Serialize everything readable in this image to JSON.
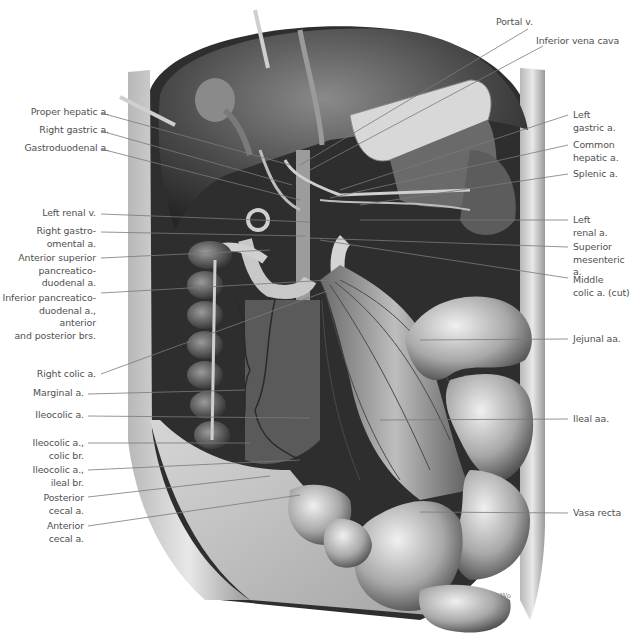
{
  "figure": {
    "style": "grayscale anatomical illustration",
    "signature": "Wo"
  },
  "labels_left": [
    {
      "id": "proper-hepatic-a",
      "text": "Proper hepatic a."
    },
    {
      "id": "right-gastric-a",
      "text": "Right gastric a."
    },
    {
      "id": "gastroduodenal-a",
      "text": "Gastroduodenal a."
    },
    {
      "id": "left-renal-v",
      "text": "Left renal v."
    },
    {
      "id": "right-gastro-omental-a",
      "text": "Right gastro-\nomental a."
    },
    {
      "id": "anterior-superior-pancreaticoduodenal-a",
      "text": "Anterior superior\npancreatico-\nduodenal a."
    },
    {
      "id": "inferior-pancreaticoduodenal-a",
      "text": "Inferior pancreatico-\nduodenal a., anterior\nand posterior brs."
    },
    {
      "id": "right-colic-a",
      "text": "Right colic a."
    },
    {
      "id": "marginal-a",
      "text": "Marginal a."
    },
    {
      "id": "ileocolic-a",
      "text": "Ileocolic a."
    },
    {
      "id": "ileocolic-a-colic-br",
      "text": "Ileocolic a.,\ncolic br."
    },
    {
      "id": "ileocolic-a-ileal-br",
      "text": "Ileocolic a.,\nileal br."
    },
    {
      "id": "posterior-cecal-a",
      "text": "Posterior\ncecal a."
    },
    {
      "id": "anterior-cecal-a",
      "text": "Anterior\ncecal a."
    }
  ],
  "labels_right": [
    {
      "id": "portal-v",
      "text": "Portal v."
    },
    {
      "id": "inferior-vena-cava",
      "text": "Inferior vena cava"
    },
    {
      "id": "left-gastric-a",
      "text": "Left\ngastric a."
    },
    {
      "id": "common-hepatic-a",
      "text": "Common\nhepatic a."
    },
    {
      "id": "splenic-a",
      "text": "Splenic a."
    },
    {
      "id": "left-renal-a",
      "text": "Left\nrenal a."
    },
    {
      "id": "superior-mesenteric-a",
      "text": "Superior\nmesenteric a."
    },
    {
      "id": "middle-colic-a-cut",
      "text": "Middle\ncolic a. (cut)"
    },
    {
      "id": "jejunal-aa",
      "text": "Jejunal aa."
    },
    {
      "id": "ileal-aa",
      "text": "Ileal aa."
    },
    {
      "id": "vasa-recta",
      "text": "Vasa recta"
    }
  ],
  "colors": {
    "background": "#ffffff",
    "label_text": "#505050",
    "leader_line": "#7a7a7a",
    "tissue_dark": "#3a3a3a",
    "tissue_mid": "#7d7d7d",
    "tissue_light": "#c9c9c9"
  }
}
